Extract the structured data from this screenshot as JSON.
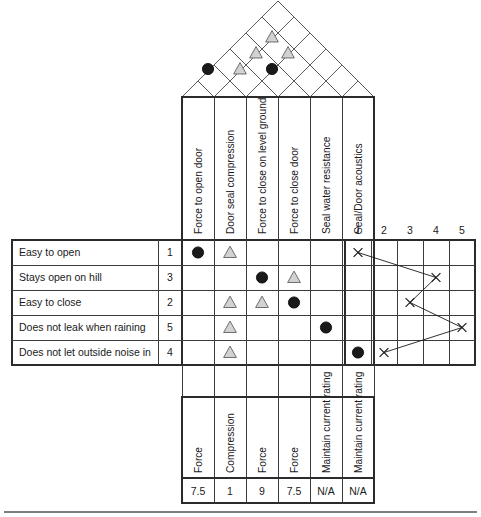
{
  "geometry": {
    "matrix_left": 182,
    "col_width": 32,
    "n_cols": 6,
    "matrix_top": 240,
    "row_height": 25,
    "n_rows": 5,
    "labels_left": 12,
    "priority_col_left": 158,
    "priority_col_width": 24,
    "right_left": 345,
    "right_col_width": 26,
    "roof_bottom": 97,
    "header_top": 97,
    "units_top": 397,
    "units_bottom": 478,
    "targets_top": 478,
    "targets_bottom": 503,
    "footer_rule_y": 512
  },
  "customer_requirements": {
    "header": "Customer Requirements",
    "rows": [
      {
        "label": "Easy to open",
        "priority": "1"
      },
      {
        "label": "Stays open on hill",
        "priority": "3"
      },
      {
        "label": "Easy to close",
        "priority": "2"
      },
      {
        "label": "Does not leak when raining",
        "priority": "5"
      },
      {
        "label": "Does not let outside noise in",
        "priority": "4"
      }
    ]
  },
  "technical_requirements": {
    "columns": [
      {
        "label": "Force to open door",
        "unit": "Force",
        "target": "7.5"
      },
      {
        "label": "Door seal compression",
        "unit": "Compression",
        "target": "1"
      },
      {
        "label": "Force to close on level ground",
        "unit": "Force",
        "target": "9"
      },
      {
        "label": "Force to close door",
        "unit": "Force",
        "target": "7.5"
      },
      {
        "label": "Seal water resistance",
        "unit": "Maintain current rating",
        "target": "N/A"
      },
      {
        "label": "Seal/Door acoustics",
        "unit": "Maintain current rating",
        "target": "N/A"
      }
    ]
  },
  "relationships": {
    "legend": {
      "strong": "strong-relationship-circle",
      "medium": "medium-relationship-triangle"
    },
    "cells": [
      {
        "row": 0,
        "col": 0,
        "symbol": "strong"
      },
      {
        "row": 0,
        "col": 1,
        "symbol": "medium"
      },
      {
        "row": 1,
        "col": 2,
        "symbol": "strong"
      },
      {
        "row": 1,
        "col": 3,
        "symbol": "medium"
      },
      {
        "row": 2,
        "col": 1,
        "symbol": "medium"
      },
      {
        "row": 2,
        "col": 2,
        "symbol": "medium"
      },
      {
        "row": 2,
        "col": 3,
        "symbol": "strong"
      },
      {
        "row": 3,
        "col": 1,
        "symbol": "medium"
      },
      {
        "row": 3,
        "col": 4,
        "symbol": "strong"
      },
      {
        "row": 4,
        "col": 1,
        "symbol": "medium"
      },
      {
        "row": 4,
        "col": 5,
        "symbol": "strong"
      }
    ]
  },
  "correlation_roof": {
    "cells": [
      {
        "cx": 208,
        "cy": 69,
        "symbol": "strong"
      },
      {
        "cx": 240,
        "cy": 69,
        "symbol": "medium"
      },
      {
        "cx": 256,
        "cy": 53,
        "symbol": "medium"
      },
      {
        "cx": 272,
        "cy": 69,
        "symbol": "strong"
      },
      {
        "cx": 272,
        "cy": 37,
        "symbol": "medium"
      },
      {
        "cx": 288,
        "cy": 53,
        "symbol": "medium"
      }
    ]
  },
  "competitive_assessment": {
    "scale": [
      "1",
      "2",
      "3",
      "4",
      "5"
    ],
    "ratings": [
      1,
      4,
      3,
      5,
      2
    ],
    "marker": "x-mark"
  }
}
